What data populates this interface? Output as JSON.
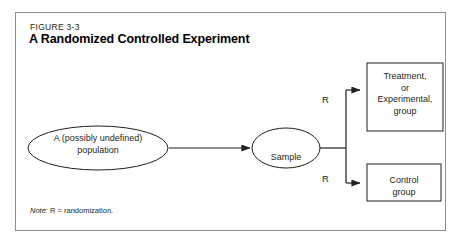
{
  "figure": {
    "label": "FIGURE 3-3",
    "title": "A Randomized Controlled Experiment",
    "note_lead": "Note:",
    "note_text": " R = randomization."
  },
  "diagram": {
    "type": "flow-diagram",
    "nodes": [
      {
        "id": "population",
        "shape": "ellipse",
        "line1": "A (possibly undefined)",
        "line2": "population"
      },
      {
        "id": "sample",
        "shape": "ellipse",
        "line1": "Sample"
      },
      {
        "id": "treatment-group",
        "shape": "rectangle",
        "line1": "Treatment,",
        "line2": "or",
        "line3": "Experimental,",
        "line4": "group"
      },
      {
        "id": "control-group",
        "shape": "rectangle",
        "line1": "Control",
        "line2": "group"
      }
    ],
    "edges": [
      {
        "from": "population",
        "to": "sample",
        "label": ""
      },
      {
        "from": "sample",
        "to": "treatment-group",
        "label": "R"
      },
      {
        "from": "sample",
        "to": "control-group",
        "label": "R"
      }
    ],
    "colors": {
      "stroke": "#231f20",
      "panel_border": "#8e8e8e",
      "text": "#231f20",
      "background": "#ffffff"
    }
  }
}
